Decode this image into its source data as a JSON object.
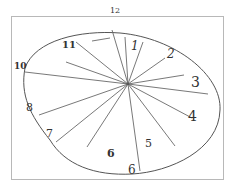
{
  "drawing": {
    "subject": "hand-drawn clock face",
    "stroke_color": "#444444",
    "frame_color": "#b0b0b0",
    "background": "#ffffff"
  },
  "numbers": [
    {
      "text": "12",
      "x": 110,
      "y": 17,
      "size": 8
    },
    {
      "text": "1",
      "x": 131,
      "y": 40,
      "size": 12
    },
    {
      "text": "2",
      "x": 167,
      "y": 48,
      "size": 12
    },
    {
      "text": "3",
      "x": 191,
      "y": 75,
      "size": 14
    },
    {
      "text": "4",
      "x": 189,
      "y": 110,
      "size": 14
    },
    {
      "text": "5",
      "x": 145,
      "y": 138,
      "size": 11
    },
    {
      "text": "6",
      "x": 128,
      "y": 163,
      "size": 12
    },
    {
      "text": "6",
      "x": 107,
      "y": 148,
      "size": 11
    },
    {
      "text": "7",
      "x": 46,
      "y": 128,
      "size": 11
    },
    {
      "text": "8",
      "x": 27,
      "y": 102,
      "size": 11
    },
    {
      "text": "10",
      "x": 14,
      "y": 62,
      "size": 9
    },
    {
      "text": "11",
      "x": 62,
      "y": 40,
      "size": 10
    }
  ]
}
